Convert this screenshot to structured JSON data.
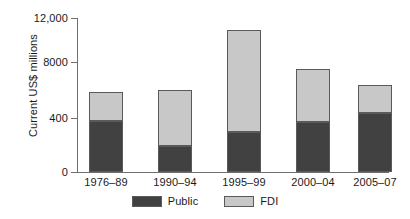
{
  "chart_data": {
    "type": "bar",
    "subtype": "stacked",
    "title": "",
    "xlabel": "",
    "ylabel": "Current US$ millions",
    "categories": [
      "1976–89",
      "1990–94",
      "1995–99",
      "2000–04",
      "2005–07"
    ],
    "series": [
      {
        "name": "Public",
        "color": "#414141",
        "values": [
          4000,
          2000,
          3100,
          3900,
          4600
        ]
      },
      {
        "name": "FDI",
        "color": "#c8c8c8",
        "values": [
          2200,
          4400,
          8000,
          4100,
          2200
        ]
      }
    ],
    "totals": [
      6200,
      6400,
      11100,
      8000,
      6800
    ],
    "ylim": [
      0,
      12000
    ],
    "ytick_values": [
      0,
      4000,
      8000,
      12000
    ],
    "ytick_labels": [
      "0",
      "400",
      "8000",
      "12,000"
    ],
    "grid": false,
    "legend_position": "bottom"
  },
  "axis": {
    "y_title": "Current US$ millions",
    "ticks": [
      {
        "label": "12,000",
        "value": 12000
      },
      {
        "label": "8000",
        "value": 8000
      },
      {
        "label": "400",
        "value": 4000
      },
      {
        "label": "0",
        "value": 0
      }
    ]
  },
  "legend": {
    "items": [
      {
        "label": "Public",
        "color": "#414141"
      },
      {
        "label": "FDI",
        "color": "#c8c8c8"
      }
    ]
  },
  "colors": {
    "public": "#414141",
    "fdi": "#c8c8c8",
    "axis": "#6e6e6e",
    "bar_outline": "#5a5a5a",
    "background": "#ffffff",
    "text": "#1a1a1a"
  }
}
